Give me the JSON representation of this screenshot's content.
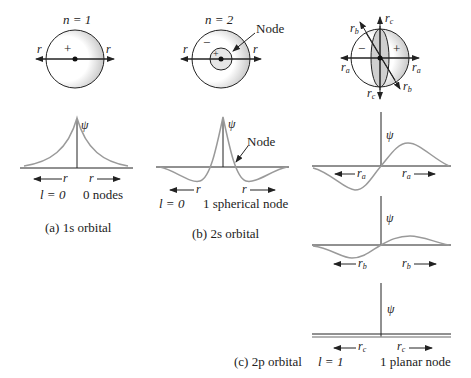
{
  "figure": {
    "panels": [
      {
        "id": "a",
        "quantum_n": "n = 1",
        "sphere_labels": {
          "left": "r",
          "right": "r",
          "sign": "+"
        },
        "psi_label": "ψ",
        "axis_left": "r",
        "axis_right": "r",
        "l_value": "l = 0",
        "nodes": "0 nodes",
        "caption": "(a) 1s orbital"
      },
      {
        "id": "b",
        "quantum_n": "n = 2",
        "sphere_labels": {
          "left": "r",
          "right": "r",
          "outer_sign": "−",
          "inner_sign": "+",
          "node_callout": "Node"
        },
        "psi_label": "ψ",
        "graph_node_callout": "Node",
        "axis_left": "r",
        "axis_right": "r",
        "l_value": "l = 0",
        "nodes": "1 spherical node",
        "caption": "(b) 2s orbital"
      },
      {
        "id": "c",
        "sphere_labels": {
          "ra_left": "r",
          "ra_right": "r",
          "ra_sub": "a",
          "rb_top": "r",
          "rb_bottom": "r",
          "rb_sub": "b",
          "rc_top": "r",
          "rc_bottom": "r",
          "rc_sub": "c",
          "neg_sign": "−",
          "pos_sign": "+"
        },
        "graphs": [
          {
            "psi_label": "ψ",
            "axis": "r",
            "sub": "a"
          },
          {
            "psi_label": "ψ",
            "axis": "r",
            "sub": "b"
          },
          {
            "psi_label": "ψ",
            "axis": "r",
            "sub": "c"
          }
        ],
        "l_value": "l = 1",
        "nodes": "1 planar node",
        "caption": "(c) 2p orbital"
      }
    ],
    "colors": {
      "curve": "#9a9a9a",
      "axis": "#222222",
      "shade": "#cfcfcf"
    }
  }
}
